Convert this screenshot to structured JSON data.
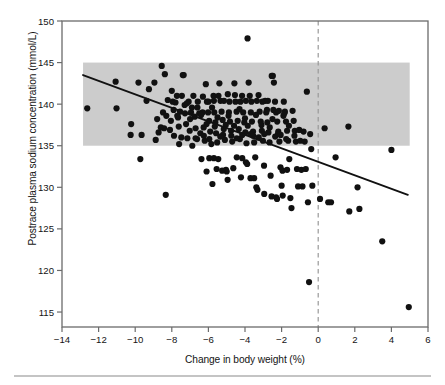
{
  "chart_data": {
    "type": "scatter",
    "title": "",
    "xlabel": "Change in body weight (%)",
    "ylabel": "Postrace plasma sodium concentration (mmol/L)",
    "xlim": [
      -14,
      6
    ],
    "ylim": [
      113.2,
      150
    ],
    "xticks": [
      -14,
      -12,
      -10,
      -8,
      -6,
      -4,
      -2,
      0,
      2,
      4,
      6
    ],
    "xticklabels": [
      "−14",
      "−12",
      "−10",
      "−8",
      "−6",
      "−4",
      "−2",
      "0",
      "2",
      "4",
      "6"
    ],
    "yticks": [
      115,
      120,
      125,
      130,
      135,
      140,
      145,
      150
    ],
    "yticklabels": [
      "115",
      "120",
      "125",
      "130",
      "135",
      "140",
      "145",
      "150"
    ],
    "grid": false,
    "legend": "none",
    "marker_color": "#111111",
    "marker_size": 3.1,
    "annotations": {
      "reference_band": {
        "name": "normal-sodium-range-band",
        "ylow": 135,
        "yhigh": 145,
        "xlow": -12.85,
        "xhigh": 5.0,
        "color": "#cccccc"
      },
      "zero_weight_line": {
        "name": "zero-weight-change-dashed-line",
        "x": 0,
        "style": "dashed",
        "color": "#999999"
      },
      "regression_line": {
        "name": "regression-trend-line",
        "x0": -12.85,
        "y0": 143.5,
        "x1": 4.9,
        "y1": 129.1,
        "color": "#111111"
      }
    },
    "points": [
      [
        -12.62,
        139.5
      ],
      [
        -11.07,
        142.7
      ],
      [
        -11.02,
        139.5
      ],
      [
        -10.25,
        136.3
      ],
      [
        -10.22,
        137.6
      ],
      [
        -9.82,
        142.6
      ],
      [
        -9.72,
        133.4
      ],
      [
        -9.65,
        136.3
      ],
      [
        -9.38,
        140.4
      ],
      [
        -9.25,
        141.8
      ],
      [
        -8.95,
        142.6
      ],
      [
        -8.88,
        135.7
      ],
      [
        -8.8,
        138.2
      ],
      [
        -8.72,
        136.6
      ],
      [
        -8.55,
        144.6
      ],
      [
        -8.48,
        139.0
      ],
      [
        -8.42,
        137.1
      ],
      [
        -8.38,
        143.6
      ],
      [
        -8.33,
        129.1
      ],
      [
        -8.22,
        140.5
      ],
      [
        -8.1,
        136.9
      ],
      [
        -8.05,
        138.0
      ],
      [
        -7.95,
        140.3
      ],
      [
        -7.88,
        136.2
      ],
      [
        -7.8,
        140.2
      ],
      [
        -7.72,
        141.0
      ],
      [
        -7.66,
        138.4
      ],
      [
        -7.6,
        135.2
      ],
      [
        -7.55,
        139.1
      ],
      [
        -7.48,
        136.0
      ],
      [
        -7.4,
        143.5
      ],
      [
        -7.35,
        143.5
      ],
      [
        -7.28,
        138.9
      ],
      [
        -7.22,
        137.6
      ],
      [
        -7.15,
        135.9
      ],
      [
        -7.08,
        140.3
      ],
      [
        -7.02,
        136.8
      ],
      [
        -6.95,
        139.0
      ],
      [
        -6.88,
        135.0
      ],
      [
        -6.82,
        141.0
      ],
      [
        -6.75,
        138.5
      ],
      [
        -6.7,
        137.1
      ],
      [
        -6.62,
        135.8
      ],
      [
        -6.58,
        140.3
      ],
      [
        -6.5,
        138.9
      ],
      [
        -6.44,
        136.5
      ],
      [
        -6.38,
        133.4
      ],
      [
        -6.32,
        139.0
      ],
      [
        -6.26,
        137.2
      ],
      [
        -6.2,
        135.6
      ],
      [
        -6.14,
        142.4
      ],
      [
        -6.08,
        140.3
      ],
      [
        -6.02,
        139.0
      ],
      [
        -5.96,
        138.0
      ],
      [
        -5.9,
        136.7
      ],
      [
        -5.84,
        135.2
      ],
      [
        -5.78,
        130.4
      ],
      [
        -5.72,
        141.0
      ],
      [
        -5.68,
        139.0
      ],
      [
        -5.62,
        137.8
      ],
      [
        -5.58,
        136.5
      ],
      [
        -5.52,
        135.4
      ],
      [
        -5.46,
        133.4
      ],
      [
        -5.4,
        142.5
      ],
      [
        -5.34,
        140.4
      ],
      [
        -5.28,
        139.1
      ],
      [
        -5.22,
        138.1
      ],
      [
        -5.16,
        137.0
      ],
      [
        -5.1,
        135.7
      ],
      [
        -5.04,
        132.1
      ],
      [
        -5.0,
        131.9
      ],
      [
        -4.94,
        141.2
      ],
      [
        -4.88,
        139.0
      ],
      [
        -4.82,
        137.9
      ],
      [
        -4.76,
        136.8
      ],
      [
        -4.7,
        135.5
      ],
      [
        -4.64,
        132.3
      ],
      [
        -4.58,
        142.5
      ],
      [
        -4.52,
        140.3
      ],
      [
        -4.46,
        139.1
      ],
      [
        -4.4,
        138.0
      ],
      [
        -4.34,
        137.0
      ],
      [
        -4.28,
        135.8
      ],
      [
        -4.22,
        131.2
      ],
      [
        -4.16,
        141.0
      ],
      [
        -4.1,
        139.0
      ],
      [
        -4.04,
        137.8
      ],
      [
        -3.98,
        136.6
      ],
      [
        -3.92,
        135.3
      ],
      [
        -3.86,
        147.9
      ],
      [
        -3.8,
        142.6
      ],
      [
        -3.74,
        141.0
      ],
      [
        -3.68,
        139.0
      ],
      [
        -3.62,
        137.9
      ],
      [
        -3.56,
        136.7
      ],
      [
        -3.5,
        135.4
      ],
      [
        -3.44,
        133.6
      ],
      [
        -3.38,
        130.0
      ],
      [
        -3.32,
        129.7
      ],
      [
        -3.26,
        141.1
      ],
      [
        -3.2,
        139.1
      ],
      [
        -3.14,
        137.9
      ],
      [
        -3.08,
        136.8
      ],
      [
        -3.02,
        135.6
      ],
      [
        -2.96,
        132.6
      ],
      [
        -2.9,
        140.4
      ],
      [
        -2.84,
        139.0
      ],
      [
        -2.78,
        137.8
      ],
      [
        -2.72,
        136.6
      ],
      [
        -2.66,
        135.4
      ],
      [
        -2.6,
        131.4
      ],
      [
        -2.54,
        143.4
      ],
      [
        -2.48,
        143.4
      ],
      [
        -2.42,
        142.6
      ],
      [
        -2.36,
        140.3
      ],
      [
        -2.3,
        139.0
      ],
      [
        -2.24,
        137.9
      ],
      [
        -2.18,
        136.7
      ],
      [
        -2.12,
        135.5
      ],
      [
        -2.06,
        132.4
      ],
      [
        -2.0,
        130.2
      ],
      [
        -1.94,
        129.0
      ],
      [
        -1.88,
        140.3
      ],
      [
        -1.82,
        139.1
      ],
      [
        -1.76,
        137.9
      ],
      [
        -1.7,
        136.8
      ],
      [
        -1.64,
        135.6
      ],
      [
        -1.58,
        133.4
      ],
      [
        -1.52,
        128.7
      ],
      [
        -1.46,
        127.5
      ],
      [
        -1.4,
        139.2
      ],
      [
        -1.34,
        138.0
      ],
      [
        -1.28,
        136.8
      ],
      [
        -1.22,
        135.5
      ],
      [
        -1.16,
        132.2
      ],
      [
        -1.1,
        130.1
      ],
      [
        -1.04,
        136.9
      ],
      [
        -0.98,
        135.6
      ],
      [
        -0.92,
        132.1
      ],
      [
        -0.86,
        130.1
      ],
      [
        -0.8,
        136.7
      ],
      [
        -0.74,
        135.5
      ],
      [
        -0.68,
        132.2
      ],
      [
        -0.62,
        141.5
      ],
      [
        -0.56,
        128.2
      ],
      [
        -0.5,
        118.6
      ],
      [
        -0.44,
        136.4
      ],
      [
        -0.38,
        134.6
      ],
      [
        -0.32,
        130.2
      ],
      [
        0.1,
        128.6
      ],
      [
        0.35,
        137.1
      ],
      [
        0.55,
        128.2
      ],
      [
        0.7,
        128.2
      ],
      [
        0.95,
        133.6
      ],
      [
        1.65,
        137.3
      ],
      [
        1.7,
        127.1
      ],
      [
        2.15,
        130.0
      ],
      [
        2.25,
        127.4
      ],
      [
        3.5,
        123.5
      ],
      [
        4.0,
        134.5
      ],
      [
        4.95,
        115.6
      ],
      [
        -7.9,
        139.3
      ],
      [
        -7.62,
        137.3
      ],
      [
        -7.3,
        139.9
      ],
      [
        -7.0,
        138.2
      ],
      [
        -6.7,
        135.9
      ],
      [
        -6.4,
        138.7
      ],
      [
        -6.1,
        137.6
      ],
      [
        -5.8,
        139.6
      ],
      [
        -5.5,
        138.4
      ],
      [
        -5.2,
        136.3
      ],
      [
        -4.9,
        138.6
      ],
      [
        -4.6,
        137.4
      ],
      [
        -4.3,
        139.4
      ],
      [
        -4.0,
        138.3
      ],
      [
        -3.7,
        136.4
      ],
      [
        -3.4,
        138.7
      ],
      [
        -3.1,
        137.5
      ],
      [
        -2.8,
        139.3
      ],
      [
        -2.5,
        138.2
      ],
      [
        -2.2,
        136.4
      ],
      [
        -1.9,
        138.6
      ],
      [
        -1.6,
        137.4
      ],
      [
        -1.3,
        136.2
      ],
      [
        -6.25,
        136.2
      ],
      [
        -5.95,
        135.8
      ],
      [
        -5.65,
        137.3
      ],
      [
        -5.35,
        136.1
      ],
      [
        -5.05,
        137.5
      ],
      [
        -4.75,
        136.2
      ],
      [
        -4.45,
        135.9
      ],
      [
        -4.15,
        136.3
      ],
      [
        -3.85,
        137.4
      ],
      [
        -3.55,
        136.2
      ],
      [
        -3.25,
        136.0
      ],
      [
        -2.95,
        136.4
      ],
      [
        -2.65,
        137.2
      ],
      [
        -2.35,
        136.1
      ],
      [
        -2.05,
        136.3
      ],
      [
        -1.75,
        135.8
      ],
      [
        -8.6,
        137.2
      ],
      [
        -8.3,
        138.6
      ],
      [
        -8.0,
        141.6
      ],
      [
        -7.7,
        138.6
      ],
      [
        -7.45,
        141.0
      ],
      [
        -7.18,
        140.1
      ],
      [
        -6.9,
        139.6
      ],
      [
        -6.6,
        139.6
      ],
      [
        -6.3,
        140.9
      ],
      [
        -6.0,
        140.3
      ],
      [
        -5.7,
        140.4
      ],
      [
        -5.45,
        141.0
      ],
      [
        -5.15,
        140.4
      ],
      [
        -4.85,
        140.3
      ],
      [
        -4.55,
        141.1
      ],
      [
        -4.25,
        140.3
      ],
      [
        -3.95,
        140.4
      ],
      [
        -3.65,
        140.3
      ],
      [
        -3.35,
        140.4
      ],
      [
        -3.05,
        140.3
      ],
      [
        -2.75,
        140.4
      ],
      [
        -2.45,
        139.3
      ],
      [
        -2.15,
        139.2
      ],
      [
        -1.85,
        138.9
      ],
      [
        -4.45,
        133.6
      ],
      [
        -4.15,
        133.5
      ],
      [
        -3.95,
        133.0
      ],
      [
        -3.88,
        132.8
      ],
      [
        -3.7,
        131.1
      ],
      [
        -3.5,
        131.1
      ],
      [
        -2.95,
        129.2
      ],
      [
        -2.55,
        128.9
      ],
      [
        -2.3,
        128.8
      ],
      [
        -2.25,
        128.6
      ],
      [
        -5.55,
        132.2
      ],
      [
        -5.25,
        132.0
      ],
      [
        -5.95,
        133.5
      ],
      [
        -5.7,
        133.5
      ],
      [
        -4.95,
        130.9
      ],
      [
        -6.1,
        131.9
      ],
      [
        -1.95,
        132.0
      ],
      [
        -1.7,
        132.1
      ]
    ]
  },
  "figure": {
    "bottom_rule": true,
    "background": "#ffffff",
    "axis_color": "#6b6b6b"
  }
}
